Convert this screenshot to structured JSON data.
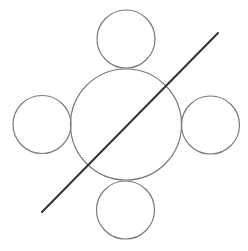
{
  "diagram": {
    "colors": {
      "background": "#ffffff",
      "circle_stroke": "#7a7a7a",
      "line_stroke": "#333333"
    },
    "shapes": [
      {
        "id": "center-circle",
        "kind": "circle",
        "role": "central"
      },
      {
        "id": "top-circle",
        "kind": "circle",
        "role": "satellite",
        "position": "top"
      },
      {
        "id": "right-circle",
        "kind": "circle",
        "role": "satellite",
        "position": "right"
      },
      {
        "id": "bottom-circle",
        "kind": "circle",
        "role": "satellite",
        "position": "bottom"
      },
      {
        "id": "left-circle",
        "kind": "circle",
        "role": "satellite",
        "position": "left"
      },
      {
        "id": "diagonal-line",
        "kind": "line",
        "direction": "bottom-left to top-right"
      }
    ]
  }
}
